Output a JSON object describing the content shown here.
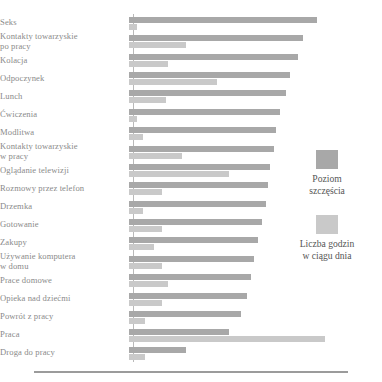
{
  "chart_data": {
    "type": "bar",
    "orientation": "horizontal",
    "title": "",
    "subtitle": "",
    "xlabel": "",
    "ylabel": "",
    "grid": false,
    "legend_position": "right",
    "axis_visible": true,
    "xlim": [
      0,
      100
    ],
    "categories": [
      "Seks",
      "Kontakty towarzyskie\npo pracy",
      "Kolacja",
      "Odpoczynek",
      "Lunch",
      "Ćwiczenia",
      "Modlitwa",
      "Kontakty towarzyskie\nw pracy",
      "Oglądanie telewizji",
      "Rozmowy przez telefon",
      "Drzemka",
      "Gotowanie",
      "Zakupy",
      "Używanie komputera\nw domu",
      "Prace domowe",
      "Opieka nad dziećmi",
      "Powrót z pracy",
      "Praca",
      "Droga do pracy"
    ],
    "series": [
      {
        "name": "Poziom szczęścia",
        "color": "#a8a8a8",
        "values": [
          96,
          89,
          86,
          82,
          80,
          77,
          75,
          74,
          72,
          71,
          70,
          68,
          66,
          64,
          62,
          60,
          57,
          51,
          29
        ]
      },
      {
        "name": "Liczba godzin w ciągu dnia",
        "color": "#c9c9c9",
        "values": [
          4,
          29,
          20,
          45,
          19,
          4,
          7,
          27,
          51,
          17,
          7,
          17,
          13,
          17,
          20,
          17,
          8,
          100,
          8
        ]
      }
    ]
  },
  "legend": {
    "items": [
      {
        "label": "Poziom\nszczęścia",
        "color": "#a8a8a8",
        "swatch_name": "happiness"
      },
      {
        "label": "Liczba godzin\nw ciągu dnia",
        "color": "#c9c9c9",
        "swatch_name": "hours"
      }
    ]
  },
  "colors": {
    "happiness": "#a8a8a8",
    "hours": "#c9c9c9",
    "axis": "#b9b9b9",
    "label_text": "#8a8a8a",
    "legend_text": "#555555",
    "footer_rule": "#9b9b9b",
    "background": "#ffffff"
  }
}
